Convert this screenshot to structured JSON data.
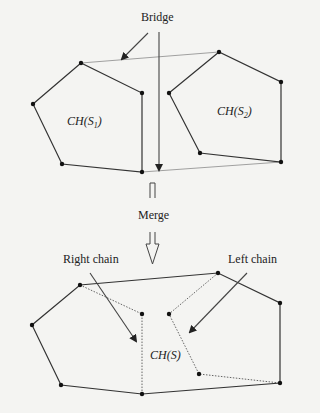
{
  "labels": {
    "bridge": "Bridge",
    "merge": "Merge",
    "right_chain": "Right chain",
    "left_chain": "Left chain",
    "hull_s1": "CH(S",
    "hull_s1_sub": "1",
    "hull_s2": "CH(S",
    "hull_s2_sub": "2",
    "hull_s": "CH(S)",
    "close_paren": ")"
  },
  "colors": {
    "background": "#f4f4f2",
    "stroke": "#333333",
    "bridge_line": "#888888",
    "dotted": "#555555"
  },
  "top": {
    "hull1_points": [
      [
        33,
        104
      ],
      [
        81,
        63
      ],
      [
        142,
        93
      ],
      [
        142,
        172
      ],
      [
        62,
        164
      ]
    ],
    "hull2_points": [
      [
        169,
        93
      ],
      [
        219,
        52
      ],
      [
        281,
        82
      ],
      [
        281,
        162
      ],
      [
        200,
        153
      ]
    ],
    "upper_bridge": [
      [
        81,
        63
      ],
      [
        219,
        52
      ]
    ],
    "lower_bridge": [
      [
        142,
        172
      ],
      [
        281,
        162
      ]
    ]
  },
  "bottom": {
    "hull_solid_path": [
      [
        142,
        394
      ],
      [
        61,
        385
      ],
      [
        32,
        325
      ],
      [
        80,
        285
      ],
      [
        218,
        273
      ],
      [
        280,
        303
      ],
      [
        280,
        383
      ],
      [
        142,
        394
      ]
    ],
    "right_chain_dotted": [
      [
        80,
        285
      ],
      [
        142,
        314
      ],
      [
        142,
        394
      ]
    ],
    "left_chain_dotted": [
      [
        218,
        273
      ],
      [
        169,
        314
      ],
      [
        199,
        374
      ],
      [
        280,
        383
      ]
    ]
  }
}
